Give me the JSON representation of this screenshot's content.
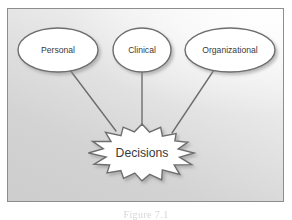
{
  "figure": {
    "caption": "Figure 7.1",
    "panel_border_color": "#8d8d8d",
    "background_light": "#fdfdfd",
    "background_dark": "#cdcdcd",
    "shape_fill": "#ffffff",
    "shape_stroke": "#6e6e6e",
    "connector_color": "#6e6e6e",
    "text_color": "#3a3a3a"
  },
  "diagram": {
    "type": "concept-map",
    "center_node": {
      "id": "decisions",
      "label": "Decisions",
      "shape": "starburst",
      "points": 16,
      "cx": 142,
      "cy": 153,
      "outer_rx": 51,
      "outer_ry": 29,
      "inner_rx": 38,
      "inner_ry": 21
    },
    "source_nodes": [
      {
        "id": "personal",
        "label": "Personal",
        "shape": "ellipse",
        "cx": 58,
        "cy": 50,
        "rx": 40,
        "ry": 22
      },
      {
        "id": "clinical",
        "label": "Clinical",
        "shape": "ellipse",
        "cx": 142,
        "cy": 50,
        "rx": 29,
        "ry": 22
      },
      {
        "id": "organizational",
        "label": "Organizational",
        "shape": "ellipse",
        "cx": 230,
        "cy": 50,
        "rx": 45,
        "ry": 22
      }
    ],
    "connectors": [
      {
        "id": "personal-to-decisions",
        "from": "personal",
        "to": "decisions",
        "x1": 70,
        "y1": 70,
        "x2": 116,
        "y2": 131
      },
      {
        "id": "clinical-to-decisions",
        "from": "clinical",
        "to": "decisions",
        "x1": 142,
        "y1": 72,
        "x2": 142,
        "y2": 127
      },
      {
        "id": "organizational-to-decisions",
        "from": "organizational",
        "to": "decisions",
        "x1": 214,
        "y1": 70,
        "x2": 172,
        "y2": 133
      }
    ]
  }
}
